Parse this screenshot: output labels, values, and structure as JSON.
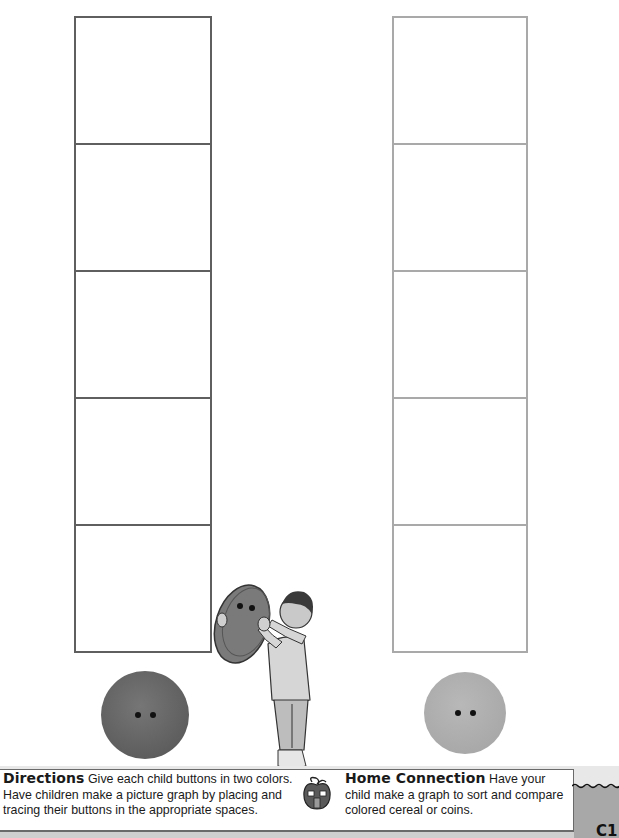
{
  "graph": {
    "columns": [
      {
        "id": "dark",
        "button_color": "dark gray",
        "rows": 5,
        "filled": 0
      },
      {
        "id": "light",
        "button_color": "light gray",
        "rows": 5,
        "filled": 0
      }
    ]
  },
  "illustration": {
    "description": "child holding a large button"
  },
  "directions": {
    "heading": "Directions",
    "text": "Give each child buttons in two colors. Have children make a picture graph by placing and tracing their buttons in the appropriate spaces."
  },
  "home_connection": {
    "heading": "Home Connection",
    "text": "Have your child make a graph to sort and compare colored cereal or coins.",
    "icon": "apple-house-icon"
  },
  "page": {
    "number": "C1"
  },
  "colors": {
    "dark_button": "#5e5e5e",
    "light_button": "#a8a8a8",
    "dark_grid": "#5f5f5f",
    "light_grid": "#a9a9a9"
  }
}
